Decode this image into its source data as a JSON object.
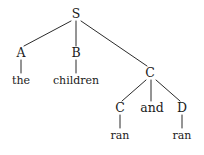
{
  "figure": {
    "kind": "syntax-tree",
    "background_color": "#ffffff",
    "line_color": "#2b2b2b",
    "text_color": "#1a1a1a",
    "width": 204,
    "height": 155
  },
  "nodes": {
    "root": {
      "label": "S",
      "x": 76,
      "y": 14
    },
    "det": {
      "label": "A",
      "x": 21,
      "y": 53
    },
    "noun": {
      "label": "B",
      "x": 76,
      "y": 53
    },
    "coord_phrase": {
      "label": "C",
      "x": 150,
      "y": 73
    },
    "conj_left": {
      "label": "C",
      "x": 120,
      "y": 108
    },
    "conjunction": {
      "label": "and",
      "x": 152,
      "y": 108
    },
    "conj_right": {
      "label": "D",
      "x": 182,
      "y": 108
    }
  },
  "leaves": {
    "the": {
      "label": "the",
      "x": 21,
      "y": 80
    },
    "children": {
      "label": "children",
      "x": 76,
      "y": 80
    },
    "ran_left": {
      "label": "ran",
      "x": 120,
      "y": 135
    },
    "ran_right": {
      "label": "ran",
      "x": 182,
      "y": 135
    }
  },
  "edges": [
    {
      "name": "s-to-a",
      "x1": 71,
      "y1": 21,
      "x2": 24,
      "y2": 46
    },
    {
      "name": "s-to-b",
      "x1": 76,
      "y1": 21,
      "x2": 76,
      "y2": 46
    },
    {
      "name": "s-to-c",
      "x1": 81,
      "y1": 21,
      "x2": 147,
      "y2": 66
    },
    {
      "name": "a-to-the",
      "x1": 21,
      "y1": 60,
      "x2": 21,
      "y2": 73
    },
    {
      "name": "b-to-children",
      "x1": 76,
      "y1": 60,
      "x2": 76,
      "y2": 73
    },
    {
      "name": "c-to-c",
      "x1": 146,
      "y1": 80,
      "x2": 122,
      "y2": 101
    },
    {
      "name": "c-to-and",
      "x1": 151,
      "y1": 80,
      "x2": 151,
      "y2": 101
    },
    {
      "name": "c-to-d",
      "x1": 156,
      "y1": 80,
      "x2": 180,
      "y2": 101
    },
    {
      "name": "c-to-ran-left",
      "x1": 120,
      "y1": 115,
      "x2": 120,
      "y2": 128
    },
    {
      "name": "d-to-ran-right",
      "x1": 182,
      "y1": 115,
      "x2": 182,
      "y2": 128
    }
  ]
}
